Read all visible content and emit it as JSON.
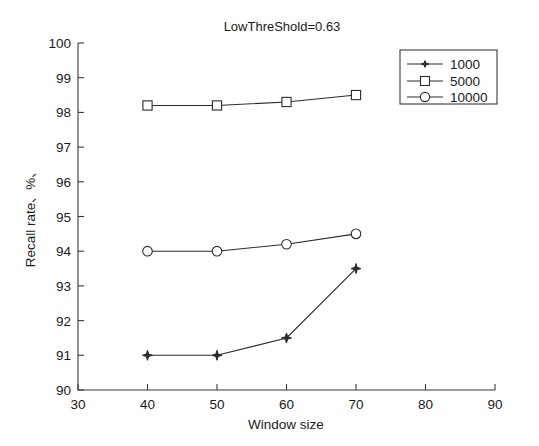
{
  "chart_data": {
    "type": "line",
    "title": "LowThreShold=0.63",
    "xlabel": "Window size",
    "ylabel": "Recall rate、%、",
    "x": [
      40,
      50,
      60,
      70
    ],
    "xlim": [
      30,
      90
    ],
    "ylim": [
      90,
      100
    ],
    "xticks": [
      30,
      40,
      50,
      60,
      70,
      80,
      90
    ],
    "xtick_labels": [
      "30",
      "40",
      "50",
      "60",
      "70",
      "80",
      "90"
    ],
    "yticks": [
      90,
      91,
      92,
      93,
      94,
      95,
      96,
      97,
      98,
      99,
      100
    ],
    "ytick_labels": [
      "90",
      "91",
      "92",
      "93",
      "94",
      "95",
      "96",
      "97",
      "98",
      "99",
      "100"
    ],
    "grid": false,
    "legend_position": "upper right",
    "series": [
      {
        "name": "1000",
        "marker": "star",
        "values": [
          91.0,
          91.0,
          91.5,
          93.5
        ]
      },
      {
        "name": "5000",
        "marker": "square",
        "values": [
          98.2,
          98.2,
          98.3,
          98.5
        ]
      },
      {
        "name": "10000",
        "marker": "circle",
        "values": [
          94.0,
          94.0,
          94.2,
          94.5
        ]
      }
    ],
    "colors": {
      "line": "#2b2b2b",
      "axis": "#3a3a3a",
      "background": "#ffffff"
    }
  },
  "legend": {
    "entries": [
      {
        "label": "1000"
      },
      {
        "label": "5000"
      },
      {
        "label": "10000"
      }
    ]
  }
}
